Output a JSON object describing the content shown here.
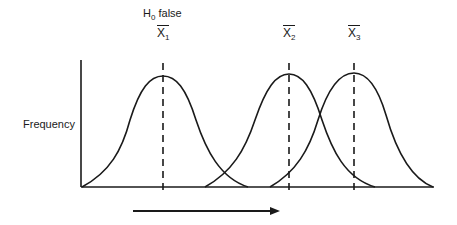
{
  "diagram": {
    "hypothesis_label": "H",
    "hypothesis_sub": "0",
    "hypothesis_suffix": " false",
    "y_axis_label": "Frequency",
    "means": [
      {
        "symbol": "X",
        "sub": "1",
        "x": 163
      },
      {
        "symbol": "X",
        "sub": "2",
        "x": 289
      },
      {
        "symbol": "X",
        "sub": "3",
        "x": 354
      }
    ],
    "arrow_direction": "right",
    "stroke_color": "#1a1a1a"
  }
}
